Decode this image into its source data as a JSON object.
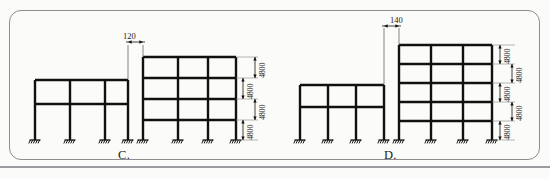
{
  "page": {
    "background_color": "#fbfbf9",
    "border_color": "#8d8d92",
    "ink_color": "#111111"
  },
  "figures": [
    {
      "id": "C",
      "label": "C.",
      "gap_dimension": "120",
      "left_frame": {
        "stories": 2,
        "bays": 3,
        "columns": 4
      },
      "right_frame": {
        "stories": 4,
        "bays": 3,
        "columns": 4
      },
      "story_heights": [
        "4800",
        "4800",
        "4800",
        "4800"
      ]
    },
    {
      "id": "D",
      "label": "D.",
      "gap_dimension": "140",
      "left_frame": {
        "stories": 2,
        "bays": 3,
        "columns": 4
      },
      "right_frame": {
        "stories": 5,
        "bays": 3,
        "columns": 4
      },
      "story_heights": [
        "4800",
        "4800",
        "4800",
        "4800",
        "4800"
      ]
    }
  ],
  "dimensions": {
    "c_gap": "120",
    "d_gap": "140",
    "c_h1": "4800",
    "c_h2": "4800",
    "c_h3": "4800",
    "c_h4": "4800",
    "d_h1": "4800",
    "d_h2": "4800",
    "d_h3": "4800",
    "d_h4": "4800",
    "d_h5": "4800"
  },
  "labels": {
    "fig_c": "C.",
    "fig_d": "D."
  }
}
